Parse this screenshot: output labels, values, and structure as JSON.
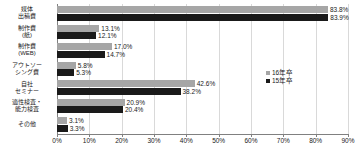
{
  "chart_data": {
    "type": "bar",
    "orientation": "horizontal",
    "title": "",
    "xlabel": "",
    "ylabel": "",
    "xlim": [
      0,
      90
    ],
    "xticks": [
      "0%",
      "10%",
      "20%",
      "30%",
      "40%",
      "50%",
      "60%",
      "70%",
      "80%",
      "90%"
    ],
    "xtick_values": [
      0,
      10,
      20,
      30,
      40,
      50,
      60,
      70,
      80,
      90
    ],
    "grid": true,
    "legend_position": "center-right",
    "categories": [
      [
        "媒体",
        "出稿費"
      ],
      [
        "制作費",
        "(紙)"
      ],
      [
        "制作費",
        "(WEB)"
      ],
      [
        "アウトソー",
        "シング費"
      ],
      [
        "自社",
        "セミナー"
      ],
      [
        "適性検査・",
        "能力検査"
      ],
      [
        "その他"
      ]
    ],
    "series": [
      {
        "name": "16年卒",
        "color": "#a6a6a6",
        "values": [
          83.8,
          13.1,
          17.0,
          5.8,
          42.6,
          20.9,
          3.1
        ],
        "labels": [
          "83.8%",
          "13.1%",
          "17.0%",
          "5.8%",
          "42.6%",
          "20.9%",
          "3.1%"
        ]
      },
      {
        "name": "15年卒",
        "color": "#1a1a1a",
        "values": [
          83.9,
          12.1,
          14.7,
          5.3,
          38.2,
          20.4,
          3.3
        ],
        "labels": [
          "83.9%",
          "12.1%",
          "14.7%",
          "5.3%",
          "38.2%",
          "20.4%",
          "3.3%"
        ]
      }
    ],
    "legend": [
      {
        "label": "16年卒",
        "color": "#a6a6a6"
      },
      {
        "label": "15年卒",
        "color": "#1a1a1a"
      }
    ]
  }
}
